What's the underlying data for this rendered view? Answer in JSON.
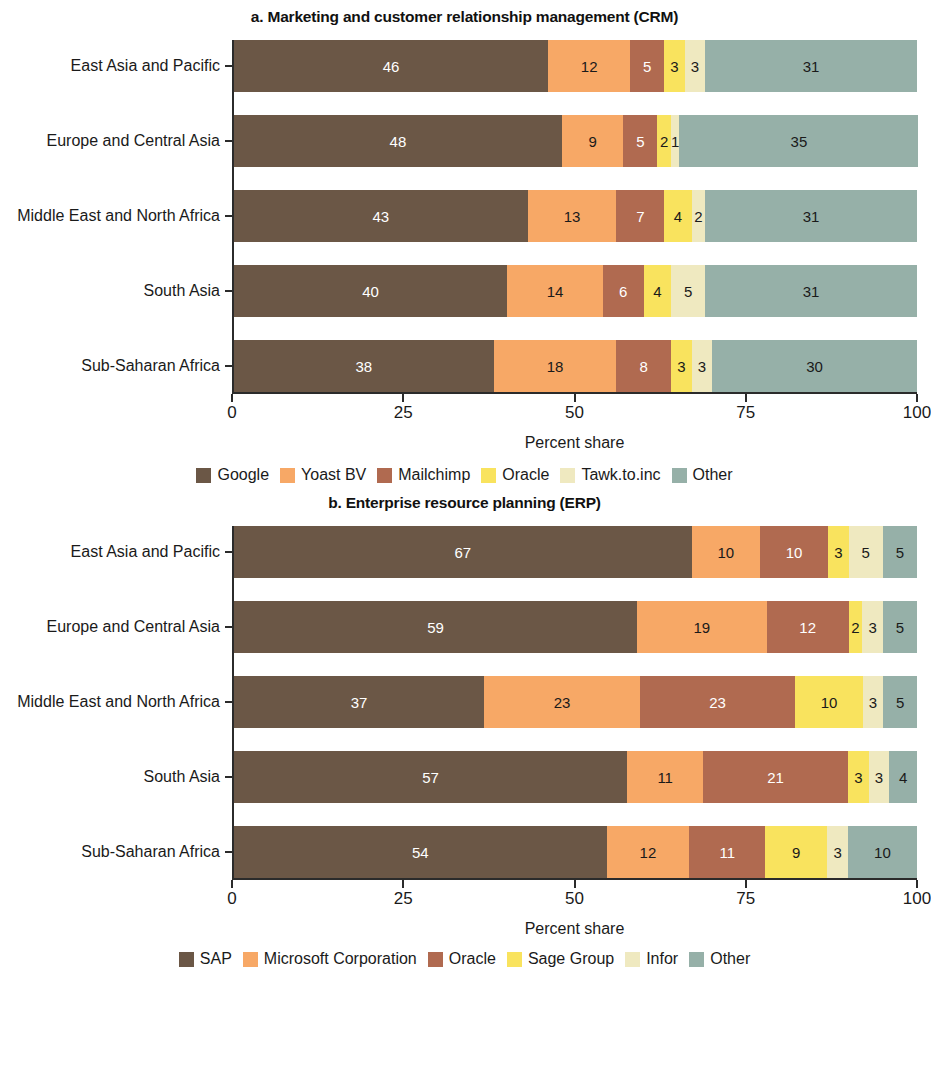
{
  "figure": {
    "axis_title": "Percent share",
    "x_ticks": [
      "0",
      "25",
      "50",
      "75",
      "100"
    ],
    "categories": [
      "East Asia and Pacific",
      "Europe and Central Asia",
      "Middle East and North Africa",
      "South Asia",
      "Sub-Saharan Africa"
    ]
  },
  "panel_a": {
    "title": "a. Marketing and customer relationship management (CRM)"
  },
  "panel_b": {
    "title": "b. Enterprise resource planning (ERP)"
  },
  "chart_data": [
    {
      "type": "bar",
      "title": "a. Marketing and customer relationship management (CRM)",
      "orientation": "horizontal",
      "stacked": true,
      "normalized_percent": true,
      "xlabel": "Percent share",
      "ylabel": "",
      "xlim": [
        0,
        100
      ],
      "xticks": [
        0,
        25,
        50,
        75,
        100
      ],
      "grid": false,
      "legend_position": "bottom",
      "categories": [
        "East Asia and Pacific",
        "Europe and Central Asia",
        "Middle East and North Africa",
        "South Asia",
        "Sub-Saharan Africa"
      ],
      "series": [
        {
          "name": "Google",
          "color": "#6B5746",
          "label_color": "#ffffff",
          "values": [
            46,
            48,
            43,
            40,
            38
          ]
        },
        {
          "name": "Yoast BV",
          "color": "#F7A866",
          "label_color": "#1a1a1a",
          "values": [
            12,
            9,
            13,
            14,
            18
          ]
        },
        {
          "name": "Mailchimp",
          "color": "#B06A50",
          "label_color": "#ffffff",
          "values": [
            5,
            5,
            7,
            6,
            8
          ]
        },
        {
          "name": "Oracle",
          "color": "#F9E35E",
          "label_color": "#1a1a1a",
          "values": [
            3,
            2,
            4,
            4,
            3
          ]
        },
        {
          "name": "Tawk.to.inc",
          "color": "#EFE9C0",
          "label_color": "#1a1a1a",
          "values": [
            3,
            1,
            2,
            5,
            3
          ]
        },
        {
          "name": "Other",
          "color": "#96B0A8",
          "label_color": "#1a1a1a",
          "values": [
            31,
            35,
            31,
            31,
            30
          ]
        }
      ]
    },
    {
      "type": "bar",
      "title": "b. Enterprise resource planning (ERP)",
      "orientation": "horizontal",
      "stacked": true,
      "normalized_percent": true,
      "xlabel": "Percent share",
      "ylabel": "",
      "xlim": [
        0,
        100
      ],
      "xticks": [
        0,
        25,
        50,
        75,
        100
      ],
      "grid": false,
      "legend_position": "bottom",
      "categories": [
        "East Asia and Pacific",
        "Europe and Central Asia",
        "Middle East and North Africa",
        "South Asia",
        "Sub-Saharan Africa"
      ],
      "series": [
        {
          "name": "SAP",
          "color": "#6B5746",
          "label_color": "#ffffff",
          "values": [
            67,
            59,
            37,
            57,
            54
          ]
        },
        {
          "name": "Microsoft Corporation",
          "color": "#F7A866",
          "label_color": "#1a1a1a",
          "values": [
            10,
            19,
            23,
            11,
            12
          ]
        },
        {
          "name": "Oracle",
          "color": "#B06A50",
          "label_color": "#ffffff",
          "values": [
            10,
            12,
            23,
            21,
            11
          ]
        },
        {
          "name": "Sage Group",
          "color": "#F9E35E",
          "label_color": "#1a1a1a",
          "values": [
            3,
            2,
            10,
            3,
            9
          ]
        },
        {
          "name": "Infor",
          "color": "#EFE9C0",
          "label_color": "#1a1a1a",
          "values": [
            5,
            3,
            3,
            3,
            3
          ]
        },
        {
          "name": "Other",
          "color": "#96B0A8",
          "label_color": "#1a1a1a",
          "values": [
            5,
            5,
            5,
            4,
            10
          ]
        }
      ]
    }
  ]
}
